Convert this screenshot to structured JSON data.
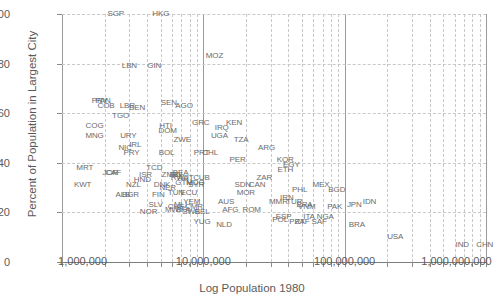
{
  "chart_data": {
    "type": "scatter",
    "title": "",
    "xlabel": "Log Population 1980",
    "ylabel": "Percent of Population in Largest City",
    "xscale": "log",
    "xlim": [
      1000000,
      1000000000
    ],
    "ylim": [
      0,
      100
    ],
    "xticks": [
      1000000,
      10000000,
      100000000,
      1000000000
    ],
    "xticklabels": [
      "1,000,000",
      "10,000,000",
      "100,000,000",
      "1,000,000,000"
    ],
    "yticks": [
      0,
      20,
      40,
      60,
      80,
      100
    ],
    "yticklabels": [
      "0",
      "20",
      "40",
      "60",
      "80",
      "100"
    ],
    "grid": "dashed-minor-log-gridlines-both-axes",
    "legend": "none",
    "marker": "text-labels-iso3",
    "points": [
      {
        "label": "SGP",
        "x": 2400000,
        "y": 100
      },
      {
        "label": "HKG",
        "x": 5000000,
        "y": 100
      },
      {
        "label": "MOZ",
        "x": 12000000,
        "y": 83
      },
      {
        "label": "LBN",
        "x": 3000000,
        "y": 79
      },
      {
        "label": "GIN",
        "x": 4500000,
        "y": 79
      },
      {
        "label": "PAN",
        "x": 1950000,
        "y": 65
      },
      {
        "label": "PRY",
        "x": 1850000,
        "y": 65
      },
      {
        "label": "COB",
        "x": 2050000,
        "y": 63
      },
      {
        "label": "LBR",
        "x": 2900000,
        "y": 63
      },
      {
        "label": "BEN",
        "x": 3400000,
        "y": 62
      },
      {
        "label": "SEN",
        "x": 5700000,
        "y": 64
      },
      {
        "label": "AGO",
        "x": 7300000,
        "y": 63
      },
      {
        "label": "TGO",
        "x": 2600000,
        "y": 59
      },
      {
        "label": "COG",
        "x": 1700000,
        "y": 55
      },
      {
        "label": "GRC",
        "x": 9600000,
        "y": 56
      },
      {
        "label": "HTI",
        "x": 5400000,
        "y": 55
      },
      {
        "label": "IRQ",
        "x": 13500000,
        "y": 54
      },
      {
        "label": "KEN",
        "x": 16500000,
        "y": 56
      },
      {
        "label": "MNG",
        "x": 1700000,
        "y": 51
      },
      {
        "label": "URY",
        "x": 2950000,
        "y": 51
      },
      {
        "label": "DOM",
        "x": 5600000,
        "y": 53
      },
      {
        "label": "UGA",
        "x": 13000000,
        "y": 51
      },
      {
        "label": "ZWE",
        "x": 7100000,
        "y": 49
      },
      {
        "label": "TZA",
        "x": 18500000,
        "y": 49
      },
      {
        "label": "NIC",
        "x": 2800000,
        "y": 46
      },
      {
        "label": "IRL",
        "x": 3300000,
        "y": 47
      },
      {
        "label": "PRY",
        "x": 3100000,
        "y": 44
      },
      {
        "label": "BOL",
        "x": 5500000,
        "y": 44
      },
      {
        "label": "PRT",
        "x": 9700000,
        "y": 44
      },
      {
        "label": "CHL",
        "x": 11200000,
        "y": 44
      },
      {
        "label": "ARG",
        "x": 28000000,
        "y": 46
      },
      {
        "label": "PER",
        "x": 17500000,
        "y": 41
      },
      {
        "label": "KOR",
        "x": 38000000,
        "y": 41
      },
      {
        "label": "EGY",
        "x": 42000000,
        "y": 39
      },
      {
        "label": "ETH",
        "x": 38000000,
        "y": 37
      },
      {
        "label": "MRT",
        "x": 1450000,
        "y": 38
      },
      {
        "label": "TCD",
        "x": 4500000,
        "y": 38
      },
      {
        "label": "CAF",
        "x": 2300000,
        "y": 36
      },
      {
        "label": "JOR",
        "x": 2200000,
        "y": 36
      },
      {
        "label": "ISR",
        "x": 3900000,
        "y": 35
      },
      {
        "label": "ZMB",
        "x": 5800000,
        "y": 35
      },
      {
        "label": "BDI",
        "x": 6400000,
        "y": 35
      },
      {
        "label": "RWA",
        "x": 6800000,
        "y": 34
      },
      {
        "label": "HND",
        "x": 3700000,
        "y": 33
      },
      {
        "label": "KWT",
        "x": 1400000,
        "y": 31
      },
      {
        "label": "NZL",
        "x": 3200000,
        "y": 31
      },
      {
        "label": "DNK",
        "x": 5100000,
        "y": 31
      },
      {
        "label": "NER",
        "x": 5600000,
        "y": 30
      },
      {
        "label": "AUT",
        "x": 7500000,
        "y": 34
      },
      {
        "label": "CUB",
        "x": 9700000,
        "y": 34
      },
      {
        "label": "BEA",
        "x": 6900000,
        "y": 36
      },
      {
        "label": "GTM",
        "x": 7300000,
        "y": 32
      },
      {
        "label": "MDG",
        "x": 8800000,
        "y": 32
      },
      {
        "label": "SYR",
        "x": 8900000,
        "y": 31
      },
      {
        "label": "ALB",
        "x": 2700000,
        "y": 27
      },
      {
        "label": "BGR",
        "x": 3050000,
        "y": 27
      },
      {
        "label": "FIN",
        "x": 4800000,
        "y": 27
      },
      {
        "label": "TUN",
        "x": 6400000,
        "y": 28
      },
      {
        "label": "ECU",
        "x": 7900000,
        "y": 28
      },
      {
        "label": "MOR",
        "x": 20000000,
        "y": 28
      },
      {
        "label": "SDN",
        "x": 19000000,
        "y": 31
      },
      {
        "label": "CAN",
        "x": 24000000,
        "y": 31
      },
      {
        "label": "ZAR",
        "x": 27000000,
        "y": 34
      },
      {
        "label": "IRN",
        "x": 39000000,
        "y": 26
      },
      {
        "label": "PHL",
        "x": 48000000,
        "y": 29
      },
      {
        "label": "MEX",
        "x": 68000000,
        "y": 31
      },
      {
        "label": "BGD",
        "x": 88000000,
        "y": 29
      },
      {
        "label": "SLV",
        "x": 4600000,
        "y": 23
      },
      {
        "label": "MLI",
        "x": 6900000,
        "y": 23
      },
      {
        "label": "CHE",
        "x": 6400000,
        "y": 22
      },
      {
        "label": "YEM",
        "x": 8300000,
        "y": 24
      },
      {
        "label": "CMR",
        "x": 8600000,
        "y": 22
      },
      {
        "label": "AUS",
        "x": 14500000,
        "y": 24
      },
      {
        "label": "NOR",
        "x": 4100000,
        "y": 20
      },
      {
        "label": "MWI",
        "x": 6100000,
        "y": 21
      },
      {
        "label": "BFA",
        "x": 7200000,
        "y": 21
      },
      {
        "label": "SWE",
        "x": 8200000,
        "y": 20
      },
      {
        "label": "BEL",
        "x": 9800000,
        "y": 20
      },
      {
        "label": "AFG",
        "x": 15500000,
        "y": 21
      },
      {
        "label": "ROM",
        "x": 22000000,
        "y": 21
      },
      {
        "label": "MMR",
        "x": 34000000,
        "y": 24
      },
      {
        "label": "TUR",
        "x": 44000000,
        "y": 24
      },
      {
        "label": "BRA2",
        "x": 52000000,
        "y": 23
      },
      {
        "label": "VNM",
        "x": 54000000,
        "y": 22
      },
      {
        "label": "PAK",
        "x": 85000000,
        "y": 22
      },
      {
        "label": "JPN",
        "x": 117000000,
        "y": 23
      },
      {
        "label": "IDN",
        "x": 150000000,
        "y": 24
      },
      {
        "label": "YUG",
        "x": 9800000,
        "y": 16
      },
      {
        "label": "NLD",
        "x": 14000000,
        "y": 15
      },
      {
        "label": "ESP",
        "x": 37000000,
        "y": 18
      },
      {
        "label": "POL",
        "x": 35000000,
        "y": 17
      },
      {
        "label": "ITA",
        "x": 56000000,
        "y": 18
      },
      {
        "label": "NGA",
        "x": 73000000,
        "y": 18
      },
      {
        "label": "PRT2",
        "x": 46000000,
        "y": 16
      },
      {
        "label": "ZAF",
        "x": 50000000,
        "y": 16
      },
      {
        "label": "SAF",
        "x": 66000000,
        "y": 16
      },
      {
        "label": "BRA",
        "x": 122000000,
        "y": 15
      },
      {
        "label": "USA",
        "x": 228000000,
        "y": 10
      },
      {
        "label": "IND",
        "x": 680000000,
        "y": 7
      },
      {
        "label": "CHN",
        "x": 980000000,
        "y": 7
      }
    ]
  },
  "axes": {
    "x_title": "Log Population 1980",
    "y_title": "Percent of Population in Largest City"
  }
}
